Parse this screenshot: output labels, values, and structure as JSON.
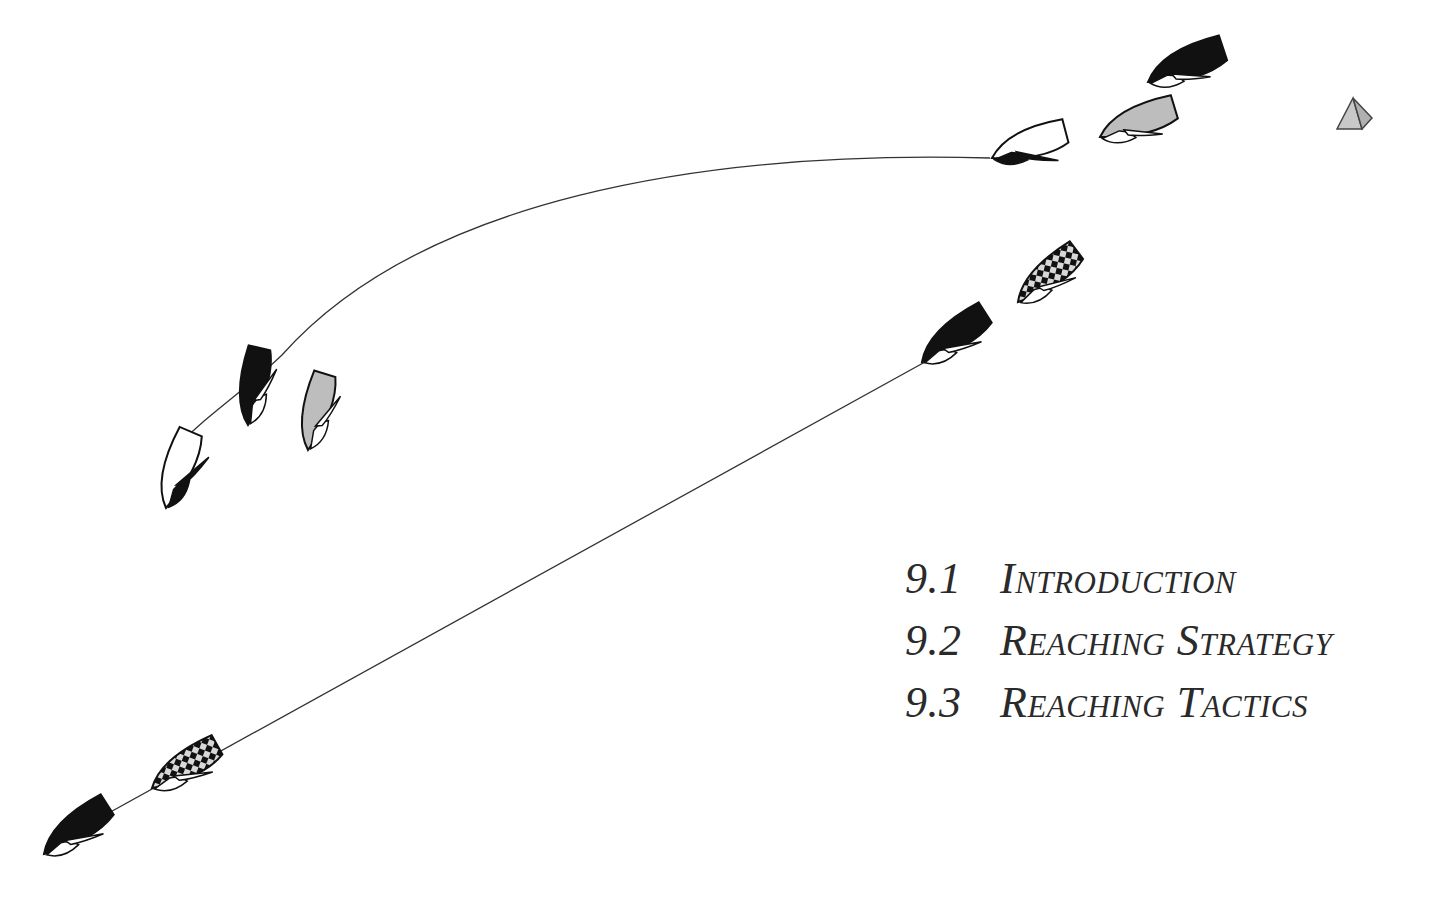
{
  "figure": {
    "colors": {
      "black_boat": "#111111",
      "gray_boat": "#bdbdbd",
      "white_boat": "#ffffff",
      "mark": "#c8c8c8",
      "track_line": "#333333",
      "text": "#2a2a2a"
    },
    "mark": {
      "icon": "pyramid-mark-icon"
    }
  },
  "toc": {
    "items": [
      {
        "number": "9.1",
        "title": "Introduction"
      },
      {
        "number": "9.2",
        "title": "Reaching Strategy"
      },
      {
        "number": "9.3",
        "title": "Reaching Tactics"
      }
    ]
  }
}
